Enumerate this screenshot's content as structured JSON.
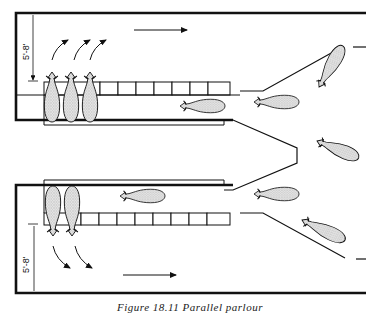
{
  "figure": {
    "type": "diagram",
    "caption": "Figure 18.11 Parallel parlour",
    "colors": {
      "ink": "#111111",
      "cow_fill": "#d8d8d8",
      "background": "#ffffff"
    }
  },
  "dimensions": {
    "top_pit_width": "5'-8'",
    "bottom_pit_width": "5'-8'"
  },
  "sections": [
    {
      "name": "upper-row",
      "cows_in_stalls": 3,
      "cows_approaching": 3,
      "stall_count": 8,
      "exit_arrows": 3,
      "flow_direction": "right"
    },
    {
      "name": "lower-row",
      "cows_in_stalls": 2,
      "cows_approaching": 3,
      "stall_count": 8,
      "exit_arrows": 2,
      "flow_direction": "right"
    }
  ]
}
